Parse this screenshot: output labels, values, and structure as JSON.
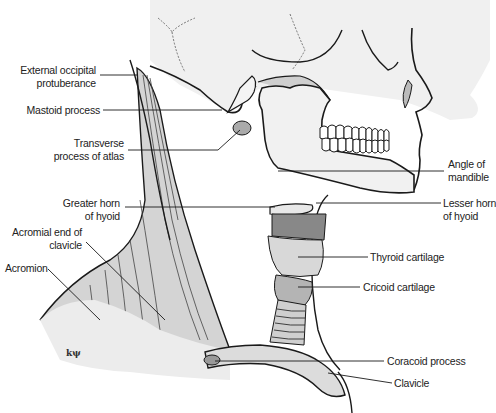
{
  "figure": {
    "signature": "kψ",
    "labels": {
      "external_occipital_protuberance": [
        "External occipital",
        "protuberance"
      ],
      "mastoid_process": [
        "Mastoid process"
      ],
      "transverse_process_of_atlas": [
        "Transverse",
        "process of atlas"
      ],
      "angle_of_mandible": [
        "Angle of",
        "mandible"
      ],
      "greater_horn_of_hyoid": [
        "Greater horn",
        "of hyoid"
      ],
      "lesser_horn_of_hyoid": [
        "Lesser horn",
        "of hyoid"
      ],
      "acromial_end_of_clavicle": [
        "Acromial end of",
        "clavicle"
      ],
      "thyroid_cartilage": [
        "Thyroid cartilage"
      ],
      "cricoid_cartilage": [
        "Cricoid cartilage"
      ],
      "acromion": [
        "Acromion"
      ],
      "coracoid_process": [
        "Coracoid process"
      ],
      "clavicle": [
        "Clavicle"
      ]
    },
    "colors": {
      "line": "#1a1a1a",
      "shade_light": "#e6e6e6",
      "shade_mid": "#c8c8c8",
      "shade_dark": "#a8a8a8",
      "text": "#222222"
    }
  }
}
